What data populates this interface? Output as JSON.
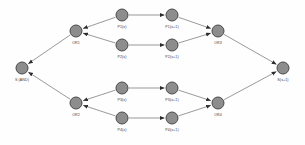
{
  "diagram": {
    "node_fill": "#8d8d8d",
    "node_stroke": "#4a4a4a",
    "edge_color": "#6f6f6f",
    "label_color": "#3a3a3a",
    "background": "#fefefe",
    "nodes": [
      {
        "id": "S_AND",
        "label": "S (AND)",
        "x": 22,
        "y": 68,
        "label_x": 22,
        "label_y": 79
      },
      {
        "id": "OR1",
        "label": "OR1",
        "x": 76,
        "y": 31,
        "label_x": 76,
        "label_y": 42
      },
      {
        "id": "OR2",
        "label": "OR2",
        "x": 76,
        "y": 103,
        "label_x": 76,
        "label_y": 114
      },
      {
        "id": "P1x",
        "label": "P1(x)",
        "x": 122,
        "y": 15,
        "label_x": 122,
        "label_y": 26
      },
      {
        "id": "P1x1",
        "label": "P1(x+1)",
        "x": 172,
        "y": 15,
        "label_x": 172,
        "label_y": 26
      },
      {
        "id": "P2x",
        "label": "P2(x)",
        "x": 122,
        "y": 45,
        "label_x": 122,
        "label_y": 56
      },
      {
        "id": "P2x1",
        "label": "P2(x+1)",
        "x": 172,
        "y": 45,
        "label_x": 172,
        "label_y": 56
      },
      {
        "id": "P3x",
        "label": "P3(x)",
        "x": 122,
        "y": 88,
        "label_x": 122,
        "label_y": 99
      },
      {
        "id": "P3x1",
        "label": "P3(x+1)",
        "x": 172,
        "y": 88,
        "label_x": 172,
        "label_y": 99
      },
      {
        "id": "P4x",
        "label": "P4(x)",
        "x": 122,
        "y": 118,
        "label_x": 122,
        "label_y": 129
      },
      {
        "id": "P4x1",
        "label": "P4(x+1)",
        "x": 172,
        "y": 118,
        "label_x": 172,
        "label_y": 129
      },
      {
        "id": "OR3",
        "label": "OR3",
        "x": 218,
        "y": 31,
        "label_x": 218,
        "label_y": 42
      },
      {
        "id": "OR4",
        "label": "OR4",
        "x": 218,
        "y": 103,
        "label_x": 218,
        "label_y": 114
      },
      {
        "id": "Sx1",
        "label": "S(x+1)",
        "x": 283,
        "y": 68,
        "label_x": 283,
        "label_y": 79
      }
    ],
    "edges": [
      {
        "id": "e-p1x-or1",
        "from": "P1x",
        "to": "OR1"
      },
      {
        "id": "e-p2x-or1",
        "from": "P2x",
        "to": "OR1"
      },
      {
        "id": "e-or1-sand",
        "from": "OR1",
        "to": "S_AND"
      },
      {
        "id": "e-p3x-or2",
        "from": "P3x",
        "to": "OR2"
      },
      {
        "id": "e-p4x-or2",
        "from": "P4x",
        "to": "OR2"
      },
      {
        "id": "e-or2-sand",
        "from": "OR2",
        "to": "S_AND"
      },
      {
        "id": "e-p1x-p1x1",
        "from": "P1x",
        "to": "P1x1"
      },
      {
        "id": "e-p2x-p2x1",
        "from": "P2x",
        "to": "P2x1"
      },
      {
        "id": "e-p3x-p3x1",
        "from": "P3x",
        "to": "P3x1"
      },
      {
        "id": "e-p4x-p4x1",
        "from": "P4x",
        "to": "P4x1"
      },
      {
        "id": "e-p1x1-or3",
        "from": "P1x1",
        "to": "OR3"
      },
      {
        "id": "e-p2x1-or3",
        "from": "P2x1",
        "to": "OR3"
      },
      {
        "id": "e-p3x1-or4",
        "from": "P3x1",
        "to": "OR4"
      },
      {
        "id": "e-p4x1-or4",
        "from": "P4x1",
        "to": "OR4"
      },
      {
        "id": "e-or3-sx1",
        "from": "OR3",
        "to": "Sx1"
      },
      {
        "id": "e-or4-sx1",
        "from": "OR4",
        "to": "Sx1"
      }
    ]
  }
}
